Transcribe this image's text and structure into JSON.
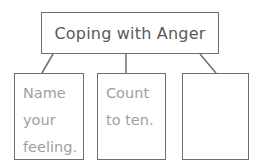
{
  "diagram": {
    "title": "Coping with Anger",
    "children": [
      {
        "text": "Name\nyour\nfeeling."
      },
      {
        "text": "Count\nto ten."
      },
      {
        "text": ""
      }
    ],
    "colors": {
      "border": "#6e6e6e",
      "title_text": "#5a5a5a",
      "child_text": "#a0a0a0"
    }
  }
}
